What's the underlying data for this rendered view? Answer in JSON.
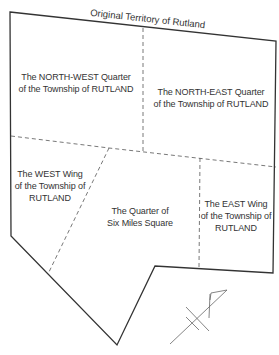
{
  "map": {
    "title": "Original Territory of Rutland",
    "regions": [
      {
        "id": "north-west",
        "line1": "The NORTH-WEST Quarter",
        "line2": "of the Township of RUTLAND"
      },
      {
        "id": "north-east",
        "line1": "The NORTH-EAST Quarter",
        "line2": "of the Township of RUTLAND"
      },
      {
        "id": "west-wing",
        "line1": "The WEST Wing",
        "line2": "of the Township of",
        "line3": "RUTLAND"
      },
      {
        "id": "six-miles",
        "line1": "The Quarter of",
        "line2": "Six Miles Square"
      },
      {
        "id": "east-wing",
        "line1": "The EAST Wing",
        "line2": "of the Township of",
        "line3": "RUTLAND"
      }
    ],
    "colors": {
      "boundary": "#333333",
      "division": "#555555",
      "text": "#333333",
      "north_arrow": "#666666"
    }
  }
}
